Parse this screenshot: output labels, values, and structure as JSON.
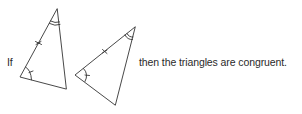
{
  "diagram": {
    "prefix_text": "If",
    "conclusion_text": "then the triangles are congruent.",
    "stroke_color": "#333333",
    "triangles": [
      {
        "name": "triangle-1",
        "vertices": [
          [
            57,
            9
          ],
          [
            20,
            77
          ],
          [
            66,
            89
          ]
        ],
        "marked_side": "apex to bottom-left (single tick)",
        "single_arc_angle": "bottom-left",
        "double_arc_angle": "apex"
      },
      {
        "name": "triangle-2",
        "vertices": [
          [
            135,
            27
          ],
          [
            75,
            75
          ],
          [
            115,
            105
          ]
        ],
        "marked_side": "apex to left (single tick)",
        "single_arc_angle": "left",
        "double_arc_angle": "apex"
      }
    ],
    "theorem": "ASA"
  }
}
